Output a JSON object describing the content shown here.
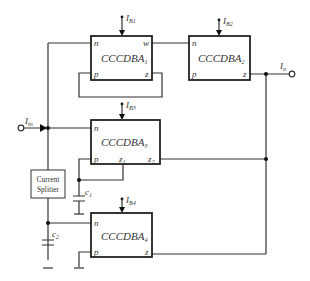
{
  "blocks": [
    {
      "id": "b1",
      "name": "CCCDBA",
      "index": "1",
      "pins": {
        "tl": "n",
        "tr": "w",
        "bl": "p",
        "br": "z"
      },
      "bias": {
        "name": "I",
        "sub": "B1"
      }
    },
    {
      "id": "b2",
      "name": "CCCDBA",
      "index": "2",
      "pins": {
        "tl": "n",
        "bl": "p",
        "br": "z"
      },
      "bias": {
        "name": "I",
        "sub": "B2"
      }
    },
    {
      "id": "b3",
      "name": "CCCDBA",
      "index": "3",
      "pins": {
        "tl": "n",
        "bl": "p",
        "bm": "z",
        "bm_sub": "1",
        "br": "z",
        "br_sub": "2"
      },
      "bias": {
        "name": "I",
        "sub": "B3"
      }
    },
    {
      "id": "b4",
      "name": "CCCDBA",
      "index": "4",
      "pins": {
        "tl": "n",
        "bl": "p",
        "br": "z"
      },
      "bias": {
        "name": "I",
        "sub": "B4"
      }
    }
  ],
  "splitter": {
    "line1": "Current",
    "line2": "Splitter"
  },
  "capacitors": [
    {
      "name": "c",
      "sub": "1"
    },
    {
      "name": "c",
      "sub": "2"
    }
  ],
  "input": {
    "name": "I",
    "sub": "in"
  },
  "output": {
    "name": "I",
    "sub": "o"
  }
}
